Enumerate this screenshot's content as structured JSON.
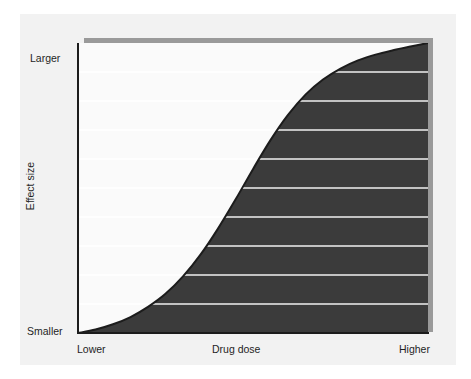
{
  "figure": {
    "background_color": "#ffffff",
    "panel_color": "#f2f2f2",
    "plot_background_color": "#fafafa",
    "shadow_color": "#9a9a9a",
    "axis_color": "#1c1c1c"
  },
  "chart_data": {
    "type": "area",
    "title": "",
    "subtitle": "",
    "xlabel": "Drug dose",
    "ylabel": "Effect size",
    "x_tick_labels": [
      "Lower",
      "Higher"
    ],
    "y_tick_labels": [
      "Smaller",
      "Larger"
    ],
    "xlim": [
      0,
      1
    ],
    "ylim": [
      0,
      1
    ],
    "grid": true,
    "grid_orientation": "horizontal",
    "grid_line_count": 10,
    "grid_color_on_light": "#ffffff",
    "grid_color_on_dark": "#f0f0f0",
    "grid_y_values": [
      0.1,
      0.2,
      0.3,
      0.4,
      0.5,
      0.6,
      0.7,
      0.8,
      0.9,
      1.0
    ],
    "legend": null,
    "legend_position": "none",
    "annotations": [],
    "series": [
      {
        "name": "Dose-response curve",
        "curve_shape": "sigmoid",
        "line_color": "#1c1c1c",
        "line_width": 2,
        "fill_color": "#3b3b3b",
        "fill_below": true,
        "x": [
          0.0,
          0.05,
          0.1,
          0.15,
          0.2,
          0.25,
          0.3,
          0.35,
          0.4,
          0.45,
          0.5,
          0.55,
          0.6,
          0.65,
          0.7,
          0.75,
          0.8,
          0.85,
          0.9,
          0.95,
          1.0
        ],
        "y": [
          0.0,
          0.012,
          0.03,
          0.055,
          0.09,
          0.135,
          0.195,
          0.27,
          0.36,
          0.46,
          0.565,
          0.665,
          0.752,
          0.822,
          0.874,
          0.912,
          0.94,
          0.96,
          0.975,
          0.988,
          1.0
        ]
      }
    ]
  },
  "labels": {
    "y_top": "Larger",
    "y_bottom": "Smaller",
    "y_axis_title": "Effect size",
    "x_left": "Lower",
    "x_center": "Drug dose",
    "x_right": "Higher"
  }
}
